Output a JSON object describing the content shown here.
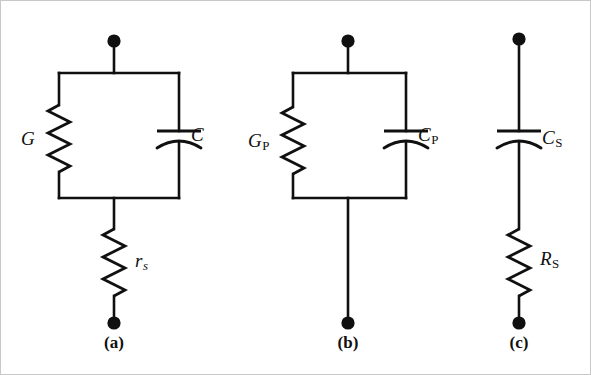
{
  "figure": {
    "type": "circuit-diagram",
    "background_color": "#ffffff",
    "line_color": "#101010",
    "border_color": "#c8c8c8",
    "width": 591,
    "height": 375
  },
  "circuits": [
    {
      "id": "a",
      "caption": "(a)",
      "caption_x": 113,
      "caption_y": 333,
      "topology": "parallel-GC-with-series-r",
      "elements": [
        {
          "kind": "resistor",
          "name": "conductance-G",
          "label": "G",
          "subscript": "",
          "label_x": 20,
          "label_y": 128
        },
        {
          "kind": "capacitor",
          "name": "capacitance-C",
          "label": "C",
          "subscript": "",
          "label_x": 190,
          "label_y": 124
        },
        {
          "kind": "resistor",
          "name": "series-resistance-rs",
          "label": "r",
          "subscript": "s",
          "subscript_italic": true,
          "label_x": 134,
          "label_y": 250
        }
      ],
      "terminals": [
        {
          "name": "top-terminal",
          "x": 113,
          "y": 40
        },
        {
          "name": "bottom-terminal",
          "x": 113,
          "y": 322
        }
      ]
    },
    {
      "id": "b",
      "caption": "(b)",
      "caption_x": 347,
      "caption_y": 333,
      "topology": "parallel-GP-CP",
      "elements": [
        {
          "kind": "resistor",
          "name": "parallel-conductance-GP",
          "label": "G",
          "subscript": "P",
          "subscript_italic": false,
          "label_x": 247,
          "label_y": 130
        },
        {
          "kind": "capacitor",
          "name": "parallel-capacitance-CP",
          "label": "C",
          "subscript": "P",
          "subscript_italic": false,
          "label_x": 417,
          "label_y": 124
        }
      ],
      "terminals": [
        {
          "name": "top-terminal",
          "x": 347,
          "y": 40
        },
        {
          "name": "bottom-terminal",
          "x": 347,
          "y": 322
        }
      ]
    },
    {
      "id": "c",
      "caption": "(c)",
      "caption_x": 518,
      "caption_y": 333,
      "topology": "series-CS-RS",
      "elements": [
        {
          "kind": "capacitor",
          "name": "series-capacitance-CS",
          "label": "C",
          "subscript": "S",
          "subscript_italic": false,
          "label_x": 541,
          "label_y": 127
        },
        {
          "kind": "resistor",
          "name": "series-resistance-RS",
          "label": "R",
          "subscript": "S",
          "subscript_italic": false,
          "label_x": 539,
          "label_y": 248
        }
      ],
      "terminals": [
        {
          "name": "top-terminal",
          "x": 518,
          "y": 38
        },
        {
          "name": "bottom-terminal",
          "x": 518,
          "y": 322
        }
      ]
    }
  ]
}
